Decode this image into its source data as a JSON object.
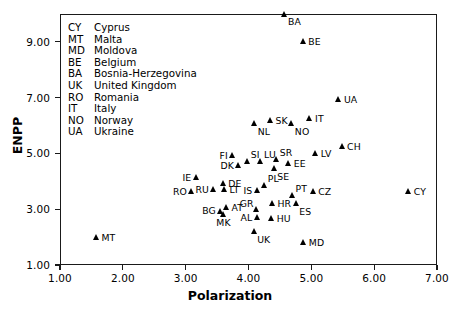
{
  "chart_data": {
    "type": "scatter",
    "title": "",
    "xlabel": "Polarization",
    "ylabel": "ENPP",
    "xlim": [
      1.0,
      7.0
    ],
    "ylim": [
      1.0,
      10.0
    ],
    "xticks": [
      "1.00",
      "2.00",
      "3.00",
      "4.00",
      "5.00",
      "6.00",
      "7.00"
    ],
    "xtick_values": [
      1.0,
      2.0,
      3.0,
      4.0,
      5.0,
      6.0,
      7.0
    ],
    "yticks": [
      "1.00",
      "3.00",
      "5.00",
      "7.00",
      "9.00"
    ],
    "ytick_values": [
      1.0,
      3.0,
      5.0,
      7.0,
      9.0
    ],
    "grid": false,
    "legend_position": "upper-left-inside",
    "marker": "filled-triangle",
    "marker_color": "#000000",
    "points": [
      {
        "code": "BA",
        "x": 4.58,
        "y": 10.0,
        "label_pos": "lbl-br"
      },
      {
        "code": "BE",
        "x": 4.87,
        "y": 9.0,
        "label_pos": "lbl-r"
      },
      {
        "code": "UA",
        "x": 5.44,
        "y": 6.95,
        "label_pos": "lbl-r"
      },
      {
        "code": "IT",
        "x": 4.98,
        "y": 6.25,
        "label_pos": "lbl-r"
      },
      {
        "code": "SK",
        "x": 4.35,
        "y": 6.18,
        "label_pos": "lbl-r"
      },
      {
        "code": "NL",
        "x": 4.1,
        "y": 6.07,
        "label_pos": "lbl-br"
      },
      {
        "code": "NO",
        "x": 4.69,
        "y": 6.07,
        "label_pos": "lbl-br"
      },
      {
        "code": "CH",
        "x": 5.49,
        "y": 5.25,
        "label_pos": "lbl-r"
      },
      {
        "code": "LV",
        "x": 5.07,
        "y": 5.0,
        "label_pos": "lbl-r"
      },
      {
        "code": "FI",
        "x": 3.75,
        "y": 4.92,
        "label_pos": "lbl-l"
      },
      {
        "code": "SR",
        "x": 4.45,
        "y": 4.8,
        "label_pos": "lbl-tr"
      },
      {
        "code": "LU",
        "x": 4.2,
        "y": 4.72,
        "label_pos": "lbl-tr"
      },
      {
        "code": "SI",
        "x": 3.99,
        "y": 4.72,
        "label_pos": "lbl-tr"
      },
      {
        "code": "EE",
        "x": 4.64,
        "y": 4.64,
        "label_pos": "lbl-r"
      },
      {
        "code": "DK",
        "x": 3.85,
        "y": 4.58,
        "label_pos": "lbl-l"
      },
      {
        "code": "SE",
        "x": 4.41,
        "y": 4.46,
        "label_pos": "lbl-br"
      },
      {
        "code": "IE",
        "x": 3.17,
        "y": 4.15,
        "label_pos": "lbl-l"
      },
      {
        "code": "DE",
        "x": 3.6,
        "y": 3.92,
        "label_pos": "lbl-r"
      },
      {
        "code": "PL",
        "x": 4.26,
        "y": 3.86,
        "label_pos": "lbl-tr"
      },
      {
        "code": "LT",
        "x": 3.62,
        "y": 3.7,
        "label_pos": "lbl-r"
      },
      {
        "code": "RU",
        "x": 3.45,
        "y": 3.7,
        "label_pos": "lbl-l"
      },
      {
        "code": "RO",
        "x": 3.1,
        "y": 3.65,
        "label_pos": "lbl-l"
      },
      {
        "code": "IS",
        "x": 4.14,
        "y": 3.66,
        "label_pos": "lbl-l"
      },
      {
        "code": "CZ",
        "x": 5.03,
        "y": 3.64,
        "label_pos": "lbl-r"
      },
      {
        "code": "CY",
        "x": 6.55,
        "y": 3.64,
        "label_pos": "lbl-r"
      },
      {
        "code": "PT",
        "x": 4.7,
        "y": 3.5,
        "label_pos": "lbl-tr"
      },
      {
        "code": "HR",
        "x": 4.38,
        "y": 3.22,
        "label_pos": "lbl-r"
      },
      {
        "code": "ES",
        "x": 4.76,
        "y": 3.2,
        "label_pos": "lbl-br"
      },
      {
        "code": "AT",
        "x": 3.65,
        "y": 3.06,
        "label_pos": "lbl-r"
      },
      {
        "code": "GR",
        "x": 4.13,
        "y": 2.98,
        "label_pos": "lbl-tl"
      },
      {
        "code": "BG",
        "x": 3.56,
        "y": 2.94,
        "label_pos": "lbl-l"
      },
      {
        "code": "MK",
        "x": 3.6,
        "y": 2.82,
        "label_pos": "lbl-b"
      },
      {
        "code": "AL",
        "x": 4.14,
        "y": 2.7,
        "label_pos": "lbl-l"
      },
      {
        "code": "HU",
        "x": 4.37,
        "y": 2.68,
        "label_pos": "lbl-r"
      },
      {
        "code": "UK",
        "x": 4.09,
        "y": 2.2,
        "label_pos": "lbl-br"
      },
      {
        "code": "MD",
        "x": 4.88,
        "y": 1.8,
        "label_pos": "lbl-r"
      },
      {
        "code": "MT",
        "x": 1.58,
        "y": 1.98,
        "label_pos": "lbl-r"
      }
    ],
    "legend_entries": [
      {
        "code": "CY",
        "name": "Cyprus"
      },
      {
        "code": "MT",
        "name": "Malta"
      },
      {
        "code": "MD",
        "name": "Moldova"
      },
      {
        "code": "BE",
        "name": "Belgium"
      },
      {
        "code": "BA",
        "name": "Bosnia-Herzegovina"
      },
      {
        "code": "UK",
        "name": "United Kingdom"
      },
      {
        "code": "RO",
        "name": "Romania"
      },
      {
        "code": "IT",
        "name": "Italy"
      },
      {
        "code": "NO",
        "name": "Norway"
      },
      {
        "code": "UA",
        "name": "Ukraine"
      }
    ]
  }
}
